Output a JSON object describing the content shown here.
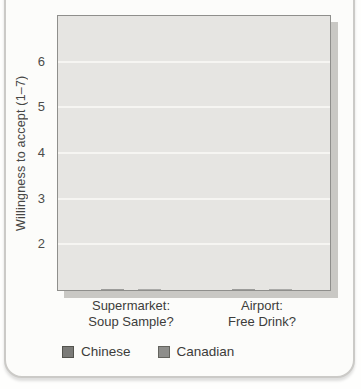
{
  "chart_data": {
    "type": "bar",
    "title": "",
    "categories": [
      "Supermarket: Soup Sample?",
      "Airport: Free Drink?"
    ],
    "category_lines": [
      [
        "Supermarket:",
        "Soup Sample?"
      ],
      [
        "Airport:",
        "Free Drink?"
      ]
    ],
    "series": [
      {
        "name": "Chinese",
        "color": "#7b7b78",
        "swatch_border": "#53534d",
        "values": [
          4.9,
          4.0
        ]
      },
      {
        "name": "Canadian",
        "color": "#8e8e8b",
        "swatch_border": "#64645e",
        "values": [
          5.75,
          4.9
        ]
      }
    ],
    "xlabel": "",
    "ylabel": "Willingness to accept (1–7)",
    "yticks": [
      2,
      3,
      4,
      5,
      6
    ],
    "ylim": [
      1,
      7
    ],
    "grid": true,
    "gridline_color": "#f6f5f2",
    "plot_background": "#e6e5e2",
    "legend_position": "bottom-left"
  }
}
